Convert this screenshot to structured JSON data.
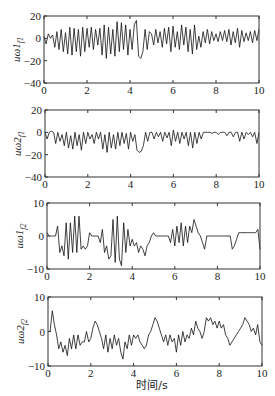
{
  "chart_data": [
    {
      "type": "line",
      "ylabel": "uω1_{f1}",
      "ylabel_main": "uω1",
      "ylabel_sub": "f1",
      "xlim": [
        0,
        10
      ],
      "ylim": [
        -40,
        20
      ],
      "xticks": [
        0,
        2,
        4,
        6,
        8,
        10
      ],
      "yticks": [
        20,
        0,
        -20,
        -40
      ],
      "grid": false,
      "x": [
        0,
        0.1,
        0.2,
        0.3,
        0.4,
        0.5,
        0.6,
        0.7,
        0.8,
        0.9,
        1.0,
        1.1,
        1.2,
        1.3,
        1.4,
        1.5,
        1.6,
        1.7,
        1.8,
        1.9,
        2.0,
        2.1,
        2.2,
        2.3,
        2.4,
        2.5,
        2.6,
        2.7,
        2.8,
        2.9,
        3.0,
        3.1,
        3.2,
        3.3,
        3.4,
        3.5,
        3.6,
        3.7,
        3.8,
        3.9,
        4.0,
        4.1,
        4.2,
        4.3,
        4.4,
        4.5,
        4.6,
        4.7,
        4.8,
        4.9,
        5.0,
        5.1,
        5.2,
        5.3,
        5.4,
        5.5,
        5.6,
        5.7,
        5.8,
        5.9,
        6.0,
        6.1,
        6.2,
        6.3,
        6.4,
        6.5,
        6.6,
        6.7,
        6.8,
        6.9,
        7.0,
        7.1,
        7.2,
        7.3,
        7.4,
        7.5,
        7.6,
        7.7,
        7.8,
        7.9,
        8.0,
        8.1,
        8.2,
        8.3,
        8.4,
        8.5,
        8.6,
        8.7,
        8.8,
        8.9,
        9.0,
        9.1,
        9.2,
        9.3,
        9.4,
        9.5,
        9.6,
        9.7,
        9.8,
        9.9,
        10.0
      ],
      "values": [
        2,
        -5,
        4,
        0,
        3,
        -8,
        6,
        -10,
        8,
        -12,
        5,
        -14,
        10,
        -15,
        9,
        -12,
        8,
        -16,
        10,
        -12,
        9,
        -8,
        10,
        -10,
        8,
        -6,
        9,
        -15,
        12,
        -18,
        10,
        -14,
        8,
        -16,
        15,
        -12,
        14,
        -10,
        12,
        -15,
        8,
        -10,
        12,
        16,
        -16,
        -18,
        -12,
        8,
        -10,
        6,
        4,
        -6,
        8,
        -4,
        6,
        -8,
        9,
        -5,
        10,
        -12,
        11,
        -8,
        6,
        -10,
        12,
        -6,
        10,
        -12,
        8,
        -14,
        12,
        -10,
        2,
        -8,
        6,
        -4,
        8,
        -5,
        6,
        -2,
        4,
        -3,
        6,
        -2,
        7,
        -3,
        8,
        -6,
        6,
        -4,
        9,
        -8,
        7,
        -3,
        5,
        -2,
        6,
        -4,
        7,
        -2,
        8,
        -10,
        2
      ]
    },
    {
      "type": "line",
      "ylabel": "uω2_{f1}",
      "ylabel_main": "uω2",
      "ylabel_sub": "f1",
      "xlim": [
        0,
        10
      ],
      "ylim": [
        -40,
        20
      ],
      "xticks": [
        0,
        2,
        4,
        6,
        8,
        10
      ],
      "yticks": [
        20,
        0,
        -20,
        -40
      ],
      "grid": false,
      "x": [
        0,
        0.1,
        0.2,
        0.3,
        0.4,
        0.5,
        0.6,
        0.7,
        0.8,
        0.9,
        1.0,
        1.1,
        1.2,
        1.3,
        1.4,
        1.5,
        1.6,
        1.7,
        1.8,
        1.9,
        2.0,
        2.1,
        2.2,
        2.3,
        2.4,
        2.5,
        2.6,
        2.7,
        2.8,
        2.9,
        3.0,
        3.1,
        3.2,
        3.3,
        3.4,
        3.5,
        3.6,
        3.7,
        3.8,
        3.9,
        4.0,
        4.1,
        4.2,
        4.3,
        4.4,
        4.5,
        4.6,
        4.7,
        4.8,
        4.9,
        5.0,
        5.1,
        5.2,
        5.3,
        5.4,
        5.5,
        5.6,
        5.7,
        5.8,
        5.9,
        6.0,
        6.1,
        6.2,
        6.3,
        6.4,
        6.5,
        6.6,
        6.7,
        6.8,
        6.9,
        7.0,
        7.1,
        7.2,
        7.3,
        7.4,
        7.5,
        7.6,
        7.7,
        7.8,
        7.9,
        8.0,
        8.1,
        8.2,
        8.3,
        8.4,
        8.5,
        8.6,
        8.7,
        8.8,
        8.9,
        9.0,
        9.1,
        9.2,
        9.3,
        9.4,
        9.5,
        9.6,
        9.7,
        9.8,
        9.9,
        10.0
      ],
      "values": [
        0,
        -6,
        0,
        1,
        0,
        -10,
        0,
        -8,
        -2,
        -12,
        0,
        -14,
        -3,
        -15,
        0,
        -12,
        -2,
        -16,
        0,
        -10,
        0,
        -6,
        -2,
        -10,
        0,
        -6,
        0,
        -15,
        -2,
        -18,
        0,
        -14,
        -2,
        -15,
        0,
        -12,
        0,
        -10,
        -1,
        -15,
        0,
        -8,
        -2,
        -16,
        -18,
        -17,
        -12,
        0,
        -8,
        0,
        0,
        -6,
        0,
        -4,
        0,
        -8,
        0,
        -5,
        0,
        -12,
        2,
        -8,
        0,
        -10,
        0,
        -6,
        0,
        -12,
        0,
        -14,
        0,
        -10,
        0,
        -6,
        0,
        0,
        0,
        0,
        -1,
        0,
        0,
        -2,
        0,
        0,
        0,
        -3,
        0,
        0,
        -4,
        0,
        0,
        -8,
        0,
        -6,
        0,
        -2,
        0,
        -4,
        0,
        -10,
        0
      ]
    },
    {
      "type": "line",
      "ylabel": "uω1_{f2}",
      "ylabel_main": "uω1",
      "ylabel_sub": "f2",
      "xlim": [
        0,
        10
      ],
      "ylim": [
        -10,
        10
      ],
      "xticks": [
        0,
        2,
        4,
        6,
        8,
        10
      ],
      "yticks": [
        10,
        0,
        -10
      ],
      "grid": false,
      "x": [
        0,
        0.1,
        0.2,
        0.3,
        0.4,
        0.5,
        0.6,
        0.7,
        0.8,
        0.9,
        1.0,
        1.1,
        1.2,
        1.3,
        1.4,
        1.5,
        1.6,
        1.7,
        1.8,
        1.9,
        2.0,
        2.1,
        2.2,
        2.3,
        2.4,
        2.5,
        2.6,
        2.7,
        2.8,
        2.9,
        3.0,
        3.1,
        3.2,
        3.3,
        3.4,
        3.5,
        3.6,
        3.7,
        3.8,
        3.9,
        4.0,
        4.1,
        4.2,
        4.3,
        4.4,
        4.5,
        4.6,
        4.7,
        4.8,
        4.9,
        5.0,
        5.1,
        5.2,
        5.3,
        5.4,
        5.5,
        5.6,
        5.7,
        5.8,
        5.9,
        6.0,
        6.1,
        6.2,
        6.3,
        6.4,
        6.5,
        6.6,
        6.7,
        6.8,
        6.9,
        7.0,
        7.1,
        7.2,
        7.3,
        7.4,
        7.5,
        7.6,
        7.7,
        7.8,
        7.9,
        8.0,
        8.1,
        8.2,
        8.3,
        8.4,
        8.5,
        8.6,
        8.7,
        8.8,
        8.9,
        9.0,
        9.1,
        9.2,
        9.3,
        9.4,
        9.5,
        9.6,
        9.7,
        9.8,
        9.9,
        10.0
      ],
      "values": [
        1,
        0,
        0,
        0,
        0,
        3,
        -5,
        -3,
        -6,
        4,
        -7,
        4,
        -5,
        6,
        -5,
        6,
        -4,
        -3,
        -4,
        -3,
        1,
        0,
        0,
        0,
        0,
        -2,
        2,
        -5,
        -3,
        -7,
        -6,
        5,
        -8,
        6,
        -7,
        -9,
        4,
        -5,
        2,
        -3,
        -1,
        -3,
        -2,
        -5,
        -3,
        -4,
        -6,
        -3,
        -2,
        0,
        1,
        0,
        0,
        0,
        0,
        0,
        0,
        0,
        -2,
        2,
        -3,
        3,
        -2,
        4,
        -3,
        3,
        -2,
        3,
        1,
        5,
        3,
        1,
        0,
        -2,
        -4,
        0,
        0,
        0,
        0,
        0,
        0,
        0,
        0,
        0,
        0,
        0,
        0,
        -4,
        -3,
        -1,
        1,
        1,
        1,
        1,
        1,
        1,
        1,
        1,
        1,
        2,
        -4
      ]
    },
    {
      "type": "line",
      "ylabel": "uω2_{f2}",
      "ylabel_main": "uω2",
      "ylabel_sub": "f2",
      "xlabel": "时间/s",
      "xlim": [
        0,
        10
      ],
      "ylim": [
        -10,
        10
      ],
      "xticks": [
        0,
        2,
        4,
        6,
        8,
        10
      ],
      "yticks": [
        10,
        0,
        -10
      ],
      "grid": false,
      "x": [
        0,
        0.1,
        0.2,
        0.3,
        0.4,
        0.5,
        0.6,
        0.7,
        0.8,
        0.9,
        1.0,
        1.1,
        1.2,
        1.3,
        1.4,
        1.5,
        1.6,
        1.7,
        1.8,
        1.9,
        2.0,
        2.1,
        2.2,
        2.3,
        2.4,
        2.5,
        2.6,
        2.7,
        2.8,
        2.9,
        3.0,
        3.1,
        3.2,
        3.3,
        3.4,
        3.5,
        3.6,
        3.7,
        3.8,
        3.9,
        4.0,
        4.1,
        4.2,
        4.3,
        4.4,
        4.5,
        4.6,
        4.7,
        4.8,
        4.9,
        5.0,
        5.1,
        5.2,
        5.3,
        5.4,
        5.5,
        5.6,
        5.7,
        5.8,
        5.9,
        6.0,
        6.1,
        6.2,
        6.3,
        6.4,
        6.5,
        6.6,
        6.7,
        6.8,
        6.9,
        7.0,
        7.1,
        7.2,
        7.3,
        7.4,
        7.5,
        7.6,
        7.7,
        7.8,
        7.9,
        8.0,
        8.1,
        8.2,
        8.3,
        8.4,
        8.5,
        8.6,
        8.7,
        8.8,
        8.9,
        9.0,
        9.1,
        9.2,
        9.3,
        9.4,
        9.5,
        9.6,
        9.7,
        9.8,
        9.9,
        10.0
      ],
      "values": [
        0,
        0,
        6,
        2,
        -1,
        -5,
        -3,
        -6,
        -4,
        -7,
        -2,
        -5,
        -1,
        -5,
        -1,
        -4,
        -3,
        -3,
        0,
        -3,
        -2,
        1,
        3,
        2,
        0,
        -2,
        -5,
        -1,
        -6,
        -2,
        -5,
        -1,
        -4,
        -2,
        -6,
        -8,
        -3,
        -5,
        -1,
        -4,
        -1,
        -2,
        -1,
        -3,
        -4,
        -5,
        -4,
        -1,
        0,
        2,
        4,
        3,
        1,
        -1,
        -3,
        -1,
        -4,
        -1,
        -3,
        -2,
        -6,
        -1,
        -4,
        0,
        -3,
        -1,
        -2,
        1,
        -1,
        3,
        1,
        0,
        -2,
        0,
        4,
        3,
        4,
        2,
        3,
        1,
        3,
        1,
        2,
        -1,
        -2,
        -4,
        -3,
        -2,
        -1,
        0,
        1,
        2,
        4,
        3,
        2,
        0,
        1,
        -1,
        2,
        -3,
        -4
      ]
    }
  ],
  "figure": {
    "xlabel": "时间/s"
  }
}
